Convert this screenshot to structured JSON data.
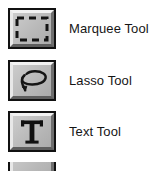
{
  "palette": {
    "background": "#ffffff",
    "button_face": "#bcbcbc",
    "button_border": "#111111",
    "button_highlight": "#f2f2f2",
    "button_shadow": "#5e5e5e",
    "icon_color": "#1a1a1a",
    "label_color": "#151515"
  },
  "tools": [
    {
      "label": "Marquee Tool",
      "icon": "marquee-dashed-rectangle-icon"
    },
    {
      "label": "Lasso Tool",
      "icon": "lasso-loop-icon"
    },
    {
      "label": "Text Tool",
      "icon": "text-serif-t-icon"
    },
    {
      "label": "",
      "icon": "partially-visible-tool-icon"
    }
  ]
}
